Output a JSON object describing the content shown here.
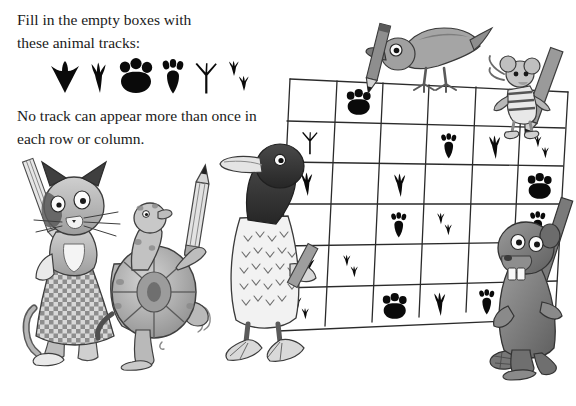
{
  "document": {
    "title": "Animal Tracks Sudoku Puzzle",
    "background_color": "#ffffff",
    "ink_color": "#0a0a0a"
  },
  "instructions": {
    "line1": "Fill in the empty boxes with",
    "line2": "these animal tracks:",
    "line3": "No track can appear more than once in",
    "line4": "each row or column."
  },
  "legend": {
    "label": "animal track key",
    "tracks": [
      {
        "id": "duck",
        "name": "duck-track-icon",
        "animal": "duck"
      },
      {
        "id": "crow",
        "name": "crow-track-icon",
        "animal": "crow"
      },
      {
        "id": "cat",
        "name": "cat-paw-track-icon",
        "animal": "cat"
      },
      {
        "id": "rabbit",
        "name": "rabbit-track-icon",
        "animal": "rabbit"
      },
      {
        "id": "turtle",
        "name": "turtle-track-icon",
        "animal": "turtle"
      },
      {
        "id": "mouse",
        "name": "mouse-track-icon",
        "animal": "mouse"
      }
    ]
  },
  "puzzle": {
    "name": "animal-tracks-grid",
    "rows": 6,
    "columns": 6,
    "empty_value": "",
    "cells": [
      [
        "",
        "cat",
        "",
        "",
        "",
        ""
      ],
      [
        "turtle",
        "",
        "",
        "rabbit",
        "crow",
        "mouse"
      ],
      [
        "crow",
        "",
        "crow",
        "",
        "",
        "cat"
      ],
      [
        "",
        "",
        "rabbit",
        "mouse",
        "",
        "rabbit"
      ],
      [
        "duck",
        "mouse",
        "",
        "",
        "",
        "turtle"
      ],
      [
        "mouse",
        "",
        "cat",
        "crow",
        "rabbit",
        "crow"
      ]
    ]
  },
  "characters": [
    {
      "id": "cat",
      "name": "cat-character",
      "label": "cat in checkered dress"
    },
    {
      "id": "turtle",
      "name": "turtle-character",
      "label": "turtle holding pencil"
    },
    {
      "id": "duck",
      "name": "duck-character",
      "label": "duck holding pencil"
    },
    {
      "id": "crow",
      "name": "crow-character",
      "label": "crow holding pencil in beak"
    },
    {
      "id": "mouse",
      "name": "mouse-character",
      "label": "mouse in striped shirt holding pencil"
    },
    {
      "id": "beaver",
      "name": "beaver-character",
      "label": "beaver holding pencil"
    }
  ]
}
